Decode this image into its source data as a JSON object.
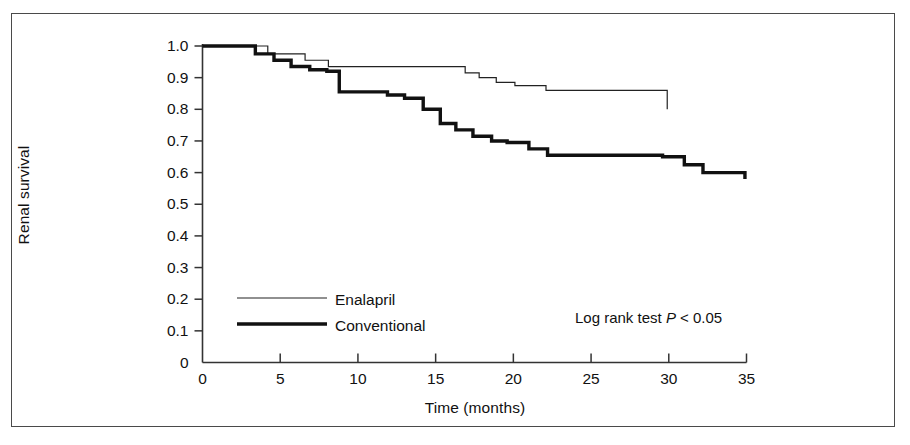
{
  "figure": {
    "border_color": "#4a4a4a",
    "background": "#ffffff"
  },
  "chart_data": {
    "type": "line",
    "title": "",
    "subtitle": "",
    "xlabel": "Time (months)",
    "ylabel": "Renal survival",
    "xlim": [
      0,
      35
    ],
    "ylim": [
      0,
      1.0
    ],
    "xticks": [
      0,
      5,
      10,
      15,
      20,
      25,
      30,
      35
    ],
    "xtick_labels": [
      "0",
      "5",
      "10",
      "15",
      "20",
      "25",
      "30",
      "35"
    ],
    "yticks": [
      0,
      0.1,
      0.2,
      0.3,
      0.4,
      0.5,
      0.6,
      0.7,
      0.8,
      0.9,
      1.0
    ],
    "ytick_labels": [
      "0",
      "0.1",
      "0.2",
      "0.3",
      "0.4",
      "0.5",
      "0.6",
      "0.7",
      "0.8",
      "0.9",
      "1.0"
    ],
    "grid": false,
    "legend_position": "lower-left-inside",
    "step_type": "post",
    "line_color": "#111111",
    "annotations": [
      {
        "name": "log-rank-annotation",
        "text_before": "Log rank test ",
        "text_italic": "P",
        "text_after": " < 0.05",
        "x": 24.0,
        "y": 0.115
      }
    ],
    "series": [
      {
        "name": "Enalapril",
        "line_width": 1.2,
        "color": "#222222",
        "x": [
          0,
          3.4,
          4.2,
          5.6,
          6.6,
          7.3,
          8.1,
          8.9,
          15.6,
          16.9,
          17.8,
          18.9,
          20.1,
          22.1,
          29.9,
          29.9
        ],
        "y": [
          1.0,
          1.0,
          0.975,
          0.975,
          0.955,
          0.955,
          0.935,
          0.935,
          0.935,
          0.915,
          0.9,
          0.885,
          0.875,
          0.86,
          0.86,
          0.8
        ],
        "steps": [
          {
            "time": 0.0,
            "survival": 1.0
          },
          {
            "time": 4.2,
            "survival": 0.975
          },
          {
            "time": 6.6,
            "survival": 0.955
          },
          {
            "time": 8.1,
            "survival": 0.935
          },
          {
            "time": 16.9,
            "survival": 0.915
          },
          {
            "time": 17.8,
            "survival": 0.9
          },
          {
            "time": 18.9,
            "survival": 0.885
          },
          {
            "time": 20.1,
            "survival": 0.875
          },
          {
            "time": 22.1,
            "survival": 0.86
          },
          {
            "time": 29.9,
            "survival": 0.8
          }
        ],
        "end_time": 29.9,
        "end_survival": 0.8
      },
      {
        "name": "Conventional",
        "line_width": 3.4,
        "color": "#111111",
        "x": [
          0,
          3.4,
          4.6,
          5.7,
          6.9,
          8.0,
          8.8,
          9.6,
          11.9,
          13.0,
          14.2,
          15.3,
          16.3,
          17.4,
          18.6,
          19.6,
          21.0,
          22.2,
          29.6,
          31.0,
          32.2,
          34.9
        ],
        "y": [
          1.0,
          1.0,
          0.975,
          0.955,
          0.935,
          0.925,
          0.92,
          0.855,
          0.845,
          0.835,
          0.8,
          0.755,
          0.735,
          0.715,
          0.7,
          0.695,
          0.675,
          0.655,
          0.65,
          0.625,
          0.6,
          0.58
        ],
        "steps": [
          {
            "time": 0.0,
            "survival": 1.0
          },
          {
            "time": 3.4,
            "survival": 0.975
          },
          {
            "time": 4.6,
            "survival": 0.955
          },
          {
            "time": 5.7,
            "survival": 0.935
          },
          {
            "time": 6.9,
            "survival": 0.925
          },
          {
            "time": 8.0,
            "survival": 0.92
          },
          {
            "time": 8.8,
            "survival": 0.855
          },
          {
            "time": 11.9,
            "survival": 0.845
          },
          {
            "time": 13.0,
            "survival": 0.835
          },
          {
            "time": 14.2,
            "survival": 0.8
          },
          {
            "time": 15.3,
            "survival": 0.755
          },
          {
            "time": 16.3,
            "survival": 0.735
          },
          {
            "time": 17.4,
            "survival": 0.715
          },
          {
            "time": 18.6,
            "survival": 0.7
          },
          {
            "time": 19.6,
            "survival": 0.695
          },
          {
            "time": 21.0,
            "survival": 0.675
          },
          {
            "time": 22.2,
            "survival": 0.655
          },
          {
            "time": 29.6,
            "survival": 0.65
          },
          {
            "time": 31.0,
            "survival": 0.625
          },
          {
            "time": 32.2,
            "survival": 0.6
          },
          {
            "time": 34.9,
            "survival": 0.58
          }
        ],
        "end_time": 34.9,
        "end_survival": 0.58
      }
    ],
    "legend": [
      {
        "label": "Enalapril",
        "line_width": 1.2,
        "color": "#222222"
      },
      {
        "label": "Conventional",
        "line_width": 3.4,
        "color": "#111111"
      }
    ]
  }
}
